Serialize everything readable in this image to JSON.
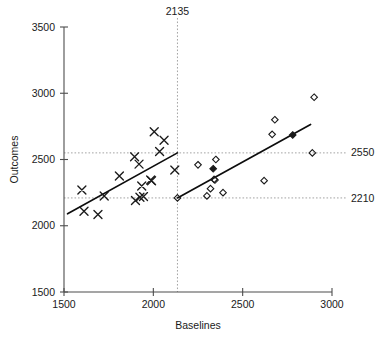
{
  "chart_data": {
    "type": "scatter",
    "title": "",
    "xlabel": "Baselines",
    "ylabel": "Outcomes",
    "xlim": [
      1500,
      3000
    ],
    "ylim": [
      1500,
      3500
    ],
    "xticks": [
      1500,
      2000,
      2500,
      3000
    ],
    "yticks": [
      1500,
      2000,
      2500,
      3000,
      3500
    ],
    "xtick_labels": [
      "1500",
      "2000",
      "2500",
      "3000"
    ],
    "ytick_labels": [
      "1500",
      "2000",
      "2500",
      "3000",
      "3500"
    ],
    "grid": false,
    "legend": "none",
    "annotations": [
      {
        "id": "vline-2135",
        "text": "2135",
        "kind": "vertical-reference",
        "value": 2135,
        "position": "top"
      },
      {
        "id": "hline-2550",
        "text": "2550",
        "kind": "horizontal-reference",
        "value": 2550,
        "position": "right"
      },
      {
        "id": "hline-2210",
        "text": "2210",
        "kind": "horizontal-reference",
        "value": 2210,
        "position": "right"
      }
    ],
    "reference_lines": [
      {
        "orientation": "vertical",
        "value": 2135,
        "style": "dotted"
      },
      {
        "orientation": "horizontal",
        "value": 2550,
        "style": "dotted"
      },
      {
        "orientation": "horizontal",
        "value": 2210,
        "style": "dotted"
      }
    ],
    "series": [
      {
        "name": "Group A",
        "marker": "x",
        "points": [
          [
            1600,
            2270
          ],
          [
            1612,
            2110
          ],
          [
            1690,
            2085
          ],
          [
            1725,
            2225
          ],
          [
            1810,
            2375
          ],
          [
            1895,
            2520
          ],
          [
            1900,
            2190
          ],
          [
            1920,
            2465
          ],
          [
            1925,
            2215
          ],
          [
            1935,
            2300
          ],
          [
            1945,
            2220
          ],
          [
            1985,
            2345
          ],
          [
            1990,
            2340
          ],
          [
            2005,
            2710
          ],
          [
            2035,
            2560
          ],
          [
            2060,
            2645
          ],
          [
            2120,
            2420
          ]
        ]
      },
      {
        "name": "Group B",
        "marker": "diamond",
        "points": [
          [
            2135,
            2210
          ],
          [
            2250,
            2460
          ],
          [
            2300,
            2225
          ],
          [
            2320,
            2280
          ],
          [
            2335,
            2430
          ],
          [
            2340,
            2350
          ],
          [
            2345,
            2345
          ],
          [
            2350,
            2500
          ],
          [
            2390,
            2250
          ],
          [
            2620,
            2340
          ],
          [
            2665,
            2690
          ],
          [
            2680,
            2800
          ],
          [
            2780,
            2685
          ],
          [
            2890,
            2550
          ],
          [
            2900,
            2970
          ]
        ],
        "filled_points": [
          [
            2335,
            2430
          ],
          [
            2780,
            2685
          ]
        ]
      }
    ],
    "trend_lines": [
      {
        "name": "Group A fit",
        "x0": 1520,
        "y0": 2090,
        "x1": 2135,
        "y1": 2550
      },
      {
        "name": "Group B fit",
        "x0": 2135,
        "y0": 2210,
        "x1": 2880,
        "y1": 2765
      }
    ]
  }
}
